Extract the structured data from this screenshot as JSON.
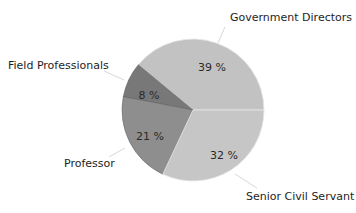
{
  "chart_data": {
    "type": "pie",
    "title": "",
    "categories": [
      "Government Directors",
      "Field Professionals",
      "Professor",
      "Senior Civil Servant"
    ],
    "values": [
      39,
      8,
      21,
      32
    ],
    "value_labels": [
      "39 %",
      "8 %",
      "21 %",
      "32 %"
    ],
    "colors": [
      "#c2c2c2",
      "#787878",
      "#8e8e8e",
      "#c6c6c6"
    ],
    "start_angle_deg": 0,
    "direction": "counterclockwise",
    "legend": "none",
    "label_style": "outside labels with leader lines; percentages inside slices"
  },
  "layout": {
    "center": [
      193,
      110
    ],
    "radius": 71,
    "labels": [
      {
        "text_pos": [
          230,
          21
        ],
        "anchor": "start",
        "leader": [
          [
            225,
            27
          ],
          [
            218,
            43
          ]
        ],
        "pct_pos": [
          212,
          71
        ]
      },
      {
        "text_pos": [
          8,
          69
        ],
        "anchor": "start",
        "leader": [
          [
            104,
            71
          ],
          [
            124,
            80
          ]
        ],
        "pct_pos": [
          149,
          99
        ]
      },
      {
        "text_pos": [
          64,
          167
        ],
        "anchor": "start",
        "leader": [
          [
            109,
            157
          ],
          [
            125,
            148
          ]
        ],
        "pct_pos": [
          150,
          140
        ]
      },
      {
        "text_pos": [
          246,
          200
        ],
        "anchor": "start",
        "leader": [
          [
            257,
            188
          ],
          [
            235,
            174
          ]
        ],
        "pct_pos": [
          224,
          159
        ]
      }
    ]
  }
}
